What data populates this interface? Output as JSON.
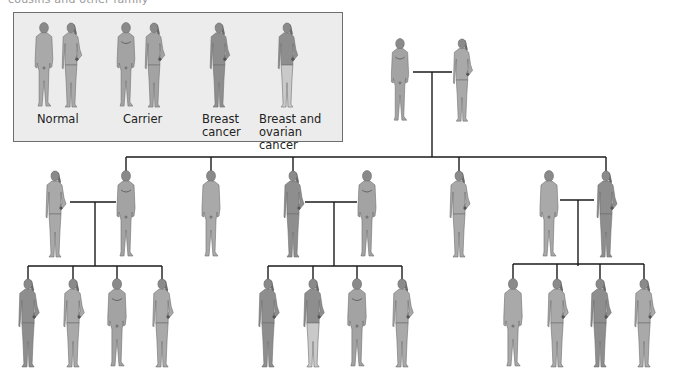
{
  "caption_fragment": "cousins and other family",
  "legend": {
    "items": [
      {
        "label": "Normal",
        "status": "normal",
        "figures": [
          "male",
          "female"
        ]
      },
      {
        "label": "Carrier",
        "status": "carrier",
        "figures": [
          "male",
          "female"
        ]
      },
      {
        "label": "Breast\ncancer",
        "label_line1": "Breast",
        "label_line2": "cancer",
        "status": "breast",
        "figures": [
          "female"
        ]
      },
      {
        "label": "Breast and ovarian cancer",
        "label_line1": "Breast and",
        "label_line2": "ovarian cancer",
        "status": "breast_ovarian",
        "figures": [
          "female"
        ]
      }
    ]
  },
  "colors": {
    "normal": "#a9a9a9",
    "carrier": "#a3a3a3",
    "breast": "#8e8e8e",
    "ovarian_lower": "#c9c9c9",
    "line": "#1a1a1a",
    "legend_bg": "#ececec"
  },
  "pedigree": {
    "generation_1": [
      {
        "sex": "male",
        "status": "carrier",
        "x": 400
      },
      {
        "sex": "female",
        "status": "normal",
        "x": 462
      }
    ],
    "generation_2": [
      {
        "sex": "female",
        "status": "normal",
        "x": 55,
        "role": "spouse"
      },
      {
        "sex": "male",
        "status": "carrier",
        "x": 126
      },
      {
        "sex": "male",
        "status": "normal",
        "x": 211
      },
      {
        "sex": "female",
        "status": "breast",
        "x": 293
      },
      {
        "sex": "male",
        "status": "carrier",
        "x": 367,
        "role": "spouse"
      },
      {
        "sex": "female",
        "status": "normal",
        "x": 459
      },
      {
        "sex": "male",
        "status": "normal",
        "x": 549,
        "role": "spouse"
      },
      {
        "sex": "female",
        "status": "breast",
        "x": 606
      }
    ],
    "generation_3": [
      {
        "sex": "female",
        "status": "breast",
        "x": 28
      },
      {
        "sex": "female",
        "status": "normal",
        "x": 73
      },
      {
        "sex": "male",
        "status": "carrier",
        "x": 117
      },
      {
        "sex": "female",
        "status": "normal",
        "x": 162
      },
      {
        "sex": "female",
        "status": "breast",
        "x": 268
      },
      {
        "sex": "female",
        "status": "breast_ovarian",
        "x": 313
      },
      {
        "sex": "male",
        "status": "carrier",
        "x": 357
      },
      {
        "sex": "female",
        "status": "normal",
        "x": 402
      },
      {
        "sex": "male",
        "status": "normal",
        "x": 513
      },
      {
        "sex": "female",
        "status": "normal",
        "x": 557
      },
      {
        "sex": "female",
        "status": "breast",
        "x": 600
      },
      {
        "sex": "female",
        "status": "normal",
        "x": 644
      }
    ]
  }
}
